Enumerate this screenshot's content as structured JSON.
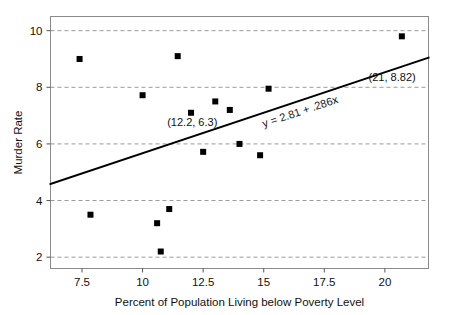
{
  "chart_data": {
    "type": "scatter",
    "title": "",
    "xlabel": "Percent of Population Living below Poverty Level",
    "ylabel": "Murder Rate",
    "xlim": [
      6.2,
      21.8
    ],
    "ylim": [
      1.6,
      10.5
    ],
    "xticks": [
      7.5,
      10,
      12.5,
      15,
      17.5,
      20
    ],
    "xticklabels": [
      "7.5",
      "10",
      "12.5",
      "15",
      "17.5",
      "20"
    ],
    "yticks": [
      2,
      4,
      6,
      8,
      10
    ],
    "yticklabels": [
      "2",
      "4",
      "6",
      "8",
      "10"
    ],
    "grid": "horizontal-dashed",
    "legend": "none",
    "marker": "square",
    "marker_color": "#000000",
    "points": [
      {
        "x": 7.4,
        "y": 9.0
      },
      {
        "x": 7.85,
        "y": 3.5
      },
      {
        "x": 10.0,
        "y": 7.72
      },
      {
        "x": 10.6,
        "y": 3.2
      },
      {
        "x": 10.75,
        "y": 2.2
      },
      {
        "x": 11.1,
        "y": 3.7
      },
      {
        "x": 11.45,
        "y": 9.1
      },
      {
        "x": 12.0,
        "y": 7.1
      },
      {
        "x": 12.5,
        "y": 5.72
      },
      {
        "x": 13.0,
        "y": 7.5
      },
      {
        "x": 13.6,
        "y": 7.2
      },
      {
        "x": 14.0,
        "y": 6.0
      },
      {
        "x": 14.85,
        "y": 5.6
      },
      {
        "x": 15.2,
        "y": 7.95
      },
      {
        "x": 20.7,
        "y": 9.8
      }
    ],
    "fit_line": {
      "equation_label": "y = 2.81 + .286x",
      "intercept": 2.81,
      "slope": 0.286,
      "color": "#000000"
    },
    "annotations": [
      {
        "name": "point-label-12-2-6-3",
        "text": "(12.2, 6.3)",
        "x": 12.05,
        "y": 6.62
      },
      {
        "name": "point-label-21-8-82",
        "text": "(21, 8.82)",
        "x": 20.3,
        "y": 8.22
      }
    ],
    "caption_fragment": ""
  }
}
